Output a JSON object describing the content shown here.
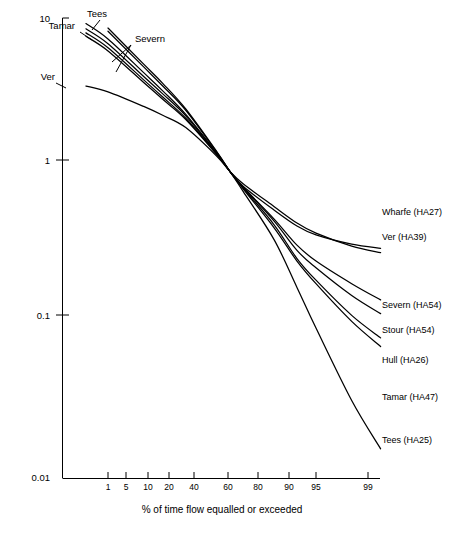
{
  "chart_data": {
    "type": "line",
    "title": "",
    "xlabel": "% of time flow equalled or exceeded",
    "ylabel": "",
    "y_scale": "log",
    "x_scale": "normal-probability",
    "ylim": [
      0.01,
      10
    ],
    "grid": false,
    "legend_position": "inline-labels",
    "y_ticks": [
      {
        "value": 10,
        "label": "10"
      },
      {
        "value": 1,
        "label": "1"
      },
      {
        "value": 0.1,
        "label": "0.1"
      },
      {
        "value": 0.01,
        "label": "0.01"
      }
    ],
    "x_ticks": [
      {
        "value": 1,
        "label": "1"
      },
      {
        "value": 5,
        "label": "5"
      },
      {
        "value": 10,
        "label": "10"
      },
      {
        "value": 20,
        "label": "20"
      },
      {
        "value": 40,
        "label": "40"
      },
      {
        "value": 60,
        "label": "60"
      },
      {
        "value": 80,
        "label": "80"
      },
      {
        "value": 90,
        "label": "90"
      },
      {
        "value": 95,
        "label": "95"
      },
      {
        "value": 99,
        "label": "99"
      }
    ],
    "x": [
      0.3,
      1,
      5,
      10,
      20,
      40,
      50,
      60,
      80,
      90,
      95,
      99,
      99.8
    ],
    "series": [
      {
        "name": "Tees",
        "label_left": "Tees",
        "label_right": "Tees (HA25)",
        "values": [
          11.0,
          8.6,
          5.0,
          3.75,
          2.55,
          1.35,
          1.0,
          0.74,
          0.36,
          0.175,
          0.095,
          0.032,
          0.0155
        ]
      },
      {
        "name": "Tamar",
        "label_left": "Tamar",
        "label_right": "Tamar (HA47)",
        "values": [
          9.2,
          7.3,
          4.4,
          3.35,
          2.35,
          1.32,
          1.0,
          0.77,
          0.43,
          0.26,
          0.185,
          0.105,
          0.072
        ]
      },
      {
        "name": "Severn",
        "label_left": "Severn",
        "label_right": "Severn (HA54)",
        "values": [
          8.5,
          6.8,
          4.15,
          3.2,
          2.3,
          1.31,
          1.0,
          0.79,
          0.49,
          0.33,
          0.26,
          0.185,
          0.145
        ]
      },
      {
        "name": "Stour",
        "label_left": "",
        "label_right": "Stour (HA54)",
        "values": [
          8.0,
          6.4,
          3.95,
          3.05,
          2.22,
          1.3,
          1.0,
          0.79,
          0.475,
          0.305,
          0.235,
          0.155,
          0.118
        ]
      },
      {
        "name": "Hull",
        "label_left": "",
        "label_right": "Hull (HA26)",
        "values": [
          7.6,
          6.1,
          3.8,
          2.95,
          2.18,
          1.29,
          1.0,
          0.78,
          0.45,
          0.27,
          0.195,
          0.115,
          0.082
        ]
      },
      {
        "name": "Wharfe",
        "label_left": "",
        "label_right": "Wharfe (HA27)",
        "values": [
          10.5,
          8.2,
          4.8,
          3.6,
          2.5,
          1.34,
          1.0,
          0.8,
          0.56,
          0.44,
          0.385,
          0.335,
          0.315
        ]
      },
      {
        "name": "Ver",
        "label_left": "Ver",
        "label_right": "Ver (HA39)",
        "values": [
          3.6,
          3.3,
          2.65,
          2.32,
          1.93,
          1.26,
          1.0,
          0.83,
          0.59,
          0.46,
          0.395,
          0.325,
          0.295
        ]
      }
    ],
    "annotations": {
      "left_labels": [
        "Tamar",
        "Tees",
        "Severn",
        "Ver"
      ],
      "right_labels": [
        "Wharfe (HA27)",
        "Ver (HA39)",
        "Severn (HA54)",
        "Stour (HA54)",
        "Hull (HA26)",
        "Tamar (HA47)",
        "Tees (HA25)"
      ]
    }
  },
  "axes": {
    "y_tick_10": "10",
    "y_tick_1": "1",
    "y_tick_0_1": "0.1",
    "y_tick_0_01": "0.01",
    "x_tick_1": "1",
    "x_tick_5": "5",
    "x_tick_10": "10",
    "x_tick_20": "20",
    "x_tick_40": "40",
    "x_tick_60": "60",
    "x_tick_80": "80",
    "x_tick_90": "90",
    "x_tick_95": "95",
    "x_tick_99": "99",
    "x_axis_title": "% of time flow equalled or exceeded"
  },
  "labels": {
    "tamar_left": "Tamar",
    "tees_left": "Tees",
    "severn_left": "Severn",
    "ver_left": "Ver",
    "wharfe_right": "Wharfe (HA27)",
    "ver_right": "Ver (HA39)",
    "severn_right": "Severn (HA54)",
    "stour_right": "Stour (HA54)",
    "hull_right": "Hull (HA26)",
    "tamar_right": "Tamar (HA47)",
    "tees_right": "Tees (HA25)"
  }
}
